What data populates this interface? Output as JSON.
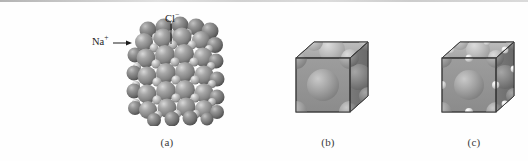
{
  "figure": {
    "background_color": "#fefefe",
    "sphere_color": "#8a8a8a",
    "sphere_highlight_color": "#d6d6d6",
    "sphere_shadow_color": "#5d5d5d",
    "cube_face_color": "#9a9a9a",
    "outline_color": "#3a3a3a"
  },
  "labels": {
    "chloride": "Cl",
    "chloride_charge": "−",
    "sodium": "Na",
    "sodium_charge": "+"
  },
  "captions": {
    "a": "(a)",
    "b": "(b)",
    "c": "(c)"
  },
  "panels": {
    "a": {
      "caption": "(a)",
      "description": "space-filling packing model of sodium chloride"
    },
    "b": {
      "caption": "(b)",
      "description": "unit cell cube showing face-centered large ions"
    },
    "c": {
      "caption": "(c)",
      "description": "unit cell cube showing large ions and small edge ions"
    }
  }
}
